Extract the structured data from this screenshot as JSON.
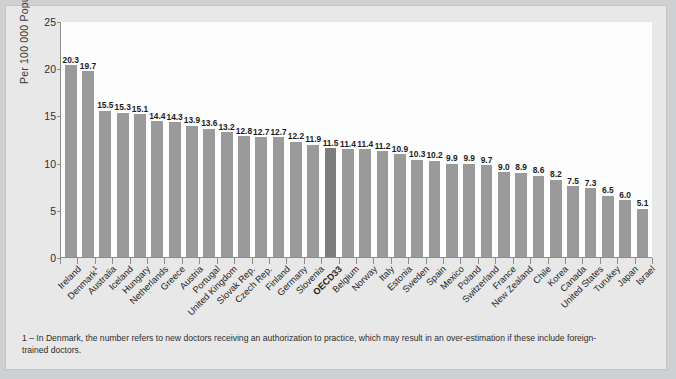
{
  "figure": {
    "footnote": "1 – In Denmark, the number refers to new doctors receiving an authorization to practice, which may result in an over-estimation if these include foreign-trained doctors."
  },
  "colors": {
    "bar": "#9a9a9a",
    "bar_highlight": "#7d7d7d",
    "plot_background": "#fdfdfd",
    "figure_background": "#e8e8e8",
    "page_background": "#cfd0d2",
    "axis": "#8c8c8c",
    "text": "#1f1f1f"
  },
  "chart_data": {
    "type": "bar",
    "title": "",
    "subtitle": "",
    "xlabel": "",
    "ylabel": "Per 100 000 Population",
    "ylim": [
      0,
      25
    ],
    "yticks": [
      0,
      5,
      10,
      15,
      20,
      25
    ],
    "ytick_labels": [
      "0",
      "5",
      "10",
      "15",
      "20",
      "25"
    ],
    "grid": false,
    "legend": null,
    "data_labels": true,
    "highlight_category": "OECD33",
    "categories": [
      "Ireland",
      "Denmark¹",
      "Australia",
      "Iceland",
      "Hungary",
      "Netherlands",
      "Greece",
      "Austria",
      "Portugal",
      "United Kingdom",
      "Slovak Rep.",
      "Czech Rep.",
      "Finland",
      "Germany",
      "Slovenia",
      "OECD33",
      "Belgium",
      "Norway",
      "Italy",
      "Estonia",
      "Sweden",
      "Spain",
      "Mexico",
      "Poland",
      "Switzerland",
      "France",
      "New Zealand",
      "Chile",
      "Korea",
      "Canada",
      "United States",
      "Turukey",
      "Japan",
      "Israel"
    ],
    "values": [
      20.3,
      19.7,
      15.5,
      15.3,
      15.1,
      14.4,
      14.3,
      13.9,
      13.6,
      13.2,
      12.8,
      12.7,
      12.7,
      12.2,
      11.9,
      11.5,
      11.4,
      11.4,
      11.2,
      10.9,
      10.3,
      10.2,
      9.9,
      9.9,
      9.7,
      9.0,
      8.9,
      8.6,
      8.2,
      7.5,
      7.3,
      6.5,
      6.0,
      5.1
    ],
    "value_labels": [
      "20.3",
      "19.7",
      "15.5",
      "15.3",
      "15.1",
      "14.4",
      "14.3",
      "13.9",
      "13.6",
      "13.2",
      "12.8",
      "12.7",
      "12.7",
      "12.2",
      "11.9",
      "11.5",
      "11.4",
      "11.4",
      "11.2",
      "10.9",
      "10.3",
      "10.2",
      "9.9",
      "9.9",
      "9.7",
      "9.0",
      "8.9",
      "8.6",
      "8.2",
      "7.5",
      "7.3",
      "6.5",
      "6.0",
      "5.1"
    ]
  }
}
